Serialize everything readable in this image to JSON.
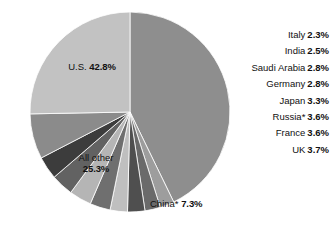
{
  "chart_data": {
    "type": "pie",
    "title": "",
    "subtitle": "",
    "xlabel": "",
    "ylabel": "",
    "legend_position": "callout-right",
    "grid": false,
    "categories": [
      "U.S.",
      "Italy",
      "India",
      "Saudi Arabia",
      "Germany",
      "Japan",
      "Russia*",
      "France",
      "UK",
      "China*",
      "All other"
    ],
    "values": [
      42.8,
      2.3,
      2.5,
      2.8,
      2.8,
      3.3,
      3.6,
      3.6,
      3.7,
      7.3,
      25.3
    ],
    "unit": "%",
    "slices": [
      {
        "label": "U.S.",
        "value": 42.8,
        "value_text": "42.8%",
        "color": "#8e8e8e",
        "label_placement": "inside"
      },
      {
        "label": "Italy",
        "value": 2.3,
        "value_text": "2.3%",
        "color": "#9d9d9d",
        "label_placement": "outside"
      },
      {
        "label": "India",
        "value": 2.5,
        "value_text": "2.5%",
        "color": "#6a6a6a",
        "label_placement": "outside"
      },
      {
        "label": "Saudi Arabia",
        "value": 2.8,
        "value_text": "2.8%",
        "color": "#4f4f4f",
        "label_placement": "outside"
      },
      {
        "label": "Germany",
        "value": 2.8,
        "value_text": "2.8%",
        "color": "#bfbfbf",
        "label_placement": "outside"
      },
      {
        "label": "Japan",
        "value": 3.3,
        "value_text": "3.3%",
        "color": "#6f6f6f",
        "label_placement": "outside"
      },
      {
        "label": "Russia*",
        "value": 3.6,
        "value_text": "3.6%",
        "color": "#b5b5b5",
        "label_placement": "outside"
      },
      {
        "label": "France",
        "value": 3.6,
        "value_text": "3.6%",
        "color": "#626262",
        "label_placement": "outside"
      },
      {
        "label": "UK",
        "value": 3.7,
        "value_text": "3.7%",
        "color": "#3c3c3c",
        "label_placement": "outside"
      },
      {
        "label": "China*",
        "value": 7.3,
        "value_text": "7.3%",
        "color": "#8b8b8b",
        "label_placement": "outside"
      },
      {
        "label": "All other",
        "value": 25.3,
        "value_text": "25.3%",
        "color": "#c2c2c2",
        "label_placement": "inside"
      }
    ]
  },
  "callouts": [
    {
      "name": "Italy",
      "pct": "2.3%"
    },
    {
      "name": "India",
      "pct": "2.5%"
    },
    {
      "name": "Saudi Arabia",
      "pct": "2.8%"
    },
    {
      "name": "Germany",
      "pct": "2.8%"
    },
    {
      "name": "Japan",
      "pct": "3.3%"
    },
    {
      "name": "Russia*",
      "pct": "3.6%"
    },
    {
      "name": "France",
      "pct": "3.6%"
    },
    {
      "name": "UK",
      "pct": "3.7%"
    }
  ],
  "inner_labels": {
    "us": {
      "name": "U.S.",
      "pct": "42.8%"
    },
    "all_other": {
      "name": "All other",
      "pct": "25.3%"
    }
  },
  "outer_labels": {
    "china": {
      "name": "China*",
      "pct": "7.3%"
    }
  },
  "colors": {
    "background": "#ffffff",
    "text": "#111111",
    "slice_outline": "#ffffff"
  }
}
